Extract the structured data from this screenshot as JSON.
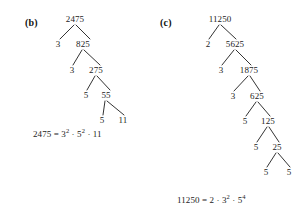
{
  "page": {
    "background_color": "#ffffff",
    "ink_color": "#1c1c1c",
    "width": 300,
    "height": 214
  },
  "parts": [
    {
      "id": "part-b",
      "label": "(b)",
      "label_x": 25,
      "label_y": 18,
      "number": "2475",
      "equation": {
        "lhs": "2475",
        "equals": "=",
        "terms": [
          {
            "base": "3",
            "exponent": "2"
          },
          {
            "base": "5",
            "exponent": "2"
          },
          {
            "base": "11",
            "exponent": ""
          }
        ],
        "dot": "·",
        "x": 33,
        "y": 130,
        "text": "2475 = 3² · 5² · 11"
      },
      "nodes": [
        {
          "name": "root",
          "text": "2475",
          "x": 75,
          "y": 19
        },
        {
          "name": "left-1",
          "text": "3",
          "x": 58,
          "y": 44
        },
        {
          "name": "right-1",
          "text": "825",
          "x": 83,
          "y": 44
        },
        {
          "name": "left-2",
          "text": "3",
          "x": 72,
          "y": 70
        },
        {
          "name": "right-2",
          "text": "275",
          "x": 96,
          "y": 70
        },
        {
          "name": "left-3",
          "text": "5",
          "x": 86,
          "y": 95
        },
        {
          "name": "right-3",
          "text": "55",
          "x": 106,
          "y": 95
        },
        {
          "name": "left-4",
          "text": "5",
          "x": 102,
          "y": 120
        },
        {
          "name": "right-4",
          "text": "11",
          "x": 123,
          "y": 120
        }
      ],
      "branches": [
        {
          "x1": 74,
          "y1": 25,
          "x2": 60,
          "y2": 39
        },
        {
          "x1": 76,
          "y1": 25,
          "x2": 90,
          "y2": 39
        },
        {
          "x1": 82,
          "y1": 50,
          "x2": 73,
          "y2": 65
        },
        {
          "x1": 84,
          "y1": 50,
          "x2": 100,
          "y2": 65
        },
        {
          "x1": 95,
          "y1": 76,
          "x2": 87,
          "y2": 90
        },
        {
          "x1": 97,
          "y1": 76,
          "x2": 110,
          "y2": 90
        },
        {
          "x1": 105,
          "y1": 101,
          "x2": 103,
          "y2": 115
        },
        {
          "x1": 107,
          "y1": 101,
          "x2": 124,
          "y2": 115
        }
      ]
    },
    {
      "id": "part-c",
      "label": "(c)",
      "label_x": 160,
      "label_y": 18,
      "number": "11250",
      "equation": {
        "lhs": "11250",
        "equals": "=",
        "terms": [
          {
            "base": "2",
            "exponent": ""
          },
          {
            "base": "3",
            "exponent": "2"
          },
          {
            "base": "5",
            "exponent": "4"
          }
        ],
        "dot": "·",
        "x": 177,
        "y": 196,
        "text": "11250 = 2 · 3² · 5⁴"
      },
      "nodes": [
        {
          "name": "root",
          "text": "11250",
          "x": 220,
          "y": 19
        },
        {
          "name": "left-1",
          "text": "2",
          "x": 208,
          "y": 44
        },
        {
          "name": "right-1",
          "text": "5625",
          "x": 235,
          "y": 44
        },
        {
          "name": "left-2",
          "text": "3",
          "x": 221,
          "y": 70
        },
        {
          "name": "right-2",
          "text": "1875",
          "x": 249,
          "y": 70
        },
        {
          "name": "left-3",
          "text": "3",
          "x": 233,
          "y": 96
        },
        {
          "name": "right-3",
          "text": "625",
          "x": 257,
          "y": 96
        },
        {
          "name": "left-4",
          "text": "5",
          "x": 245,
          "y": 121
        },
        {
          "name": "right-4",
          "text": "125",
          "x": 268,
          "y": 121
        },
        {
          "name": "left-5",
          "text": "5",
          "x": 256,
          "y": 147
        },
        {
          "name": "right-5",
          "text": "25",
          "x": 277,
          "y": 147
        },
        {
          "name": "left-6",
          "text": "5",
          "x": 266,
          "y": 172
        },
        {
          "name": "right-6",
          "text": "5",
          "x": 289,
          "y": 172
        }
      ],
      "branches": [
        {
          "x1": 219,
          "y1": 25,
          "x2": 209,
          "y2": 39
        },
        {
          "x1": 221,
          "y1": 25,
          "x2": 236,
          "y2": 39
        },
        {
          "x1": 234,
          "y1": 50,
          "x2": 222,
          "y2": 65
        },
        {
          "x1": 236,
          "y1": 50,
          "x2": 251,
          "y2": 65
        },
        {
          "x1": 248,
          "y1": 76,
          "x2": 234,
          "y2": 91
        },
        {
          "x1": 250,
          "y1": 76,
          "x2": 260,
          "y2": 91
        },
        {
          "x1": 256,
          "y1": 102,
          "x2": 246,
          "y2": 116
        },
        {
          "x1": 258,
          "y1": 102,
          "x2": 270,
          "y2": 116
        },
        {
          "x1": 267,
          "y1": 127,
          "x2": 257,
          "y2": 142
        },
        {
          "x1": 269,
          "y1": 127,
          "x2": 279,
          "y2": 142
        },
        {
          "x1": 276,
          "y1": 153,
          "x2": 267,
          "y2": 167
        },
        {
          "x1": 278,
          "y1": 153,
          "x2": 290,
          "y2": 167
        }
      ]
    }
  ]
}
